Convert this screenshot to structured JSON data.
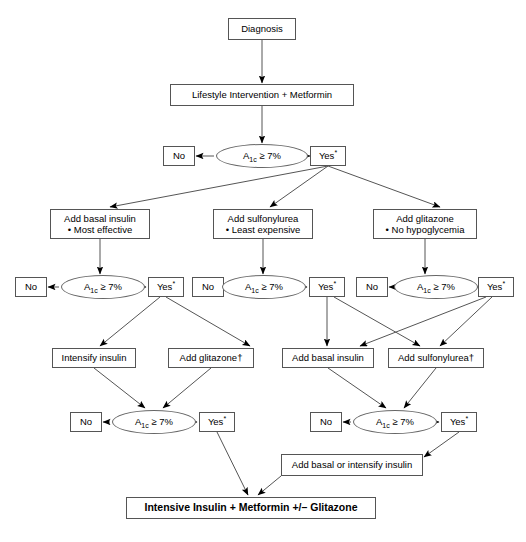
{
  "diagram": {
    "background_color": "#ffffff",
    "line_color": "#555555",
    "text_color": "#000000",
    "labels": {
      "diagnosis": "Diagnosis",
      "lifestyle": "Lifestyle Intervention + Metformin",
      "no": "No",
      "yes": "Yes",
      "yes_marker": "*",
      "a1c_prefix": "A",
      "a1c_sub": "1c",
      "a1c_suffix": " ≥ 7%",
      "basal_insulin_title": "Add basal insulin",
      "basal_insulin_note": "• Most effective",
      "sulfonylurea_title": "Add sulfonylurea",
      "sulfonylurea_note": "• Least expensive",
      "glitazone_title": "Add glitazone",
      "glitazone_note": "• No hypoglycemia",
      "intensify_insulin": "Intensify insulin",
      "add_glitazone_dagger": "Add glitazone†",
      "add_basal_insulin": "Add basal insulin",
      "add_sulfonylurea_dagger": "Add sulfonylurea†",
      "add_basal_or_intensify": "Add basal or intensify insulin",
      "final": "Intensive Insulin + Metformin +/– Glitazone"
    }
  },
  "nodes": [
    {
      "id": "diagnosis",
      "key": "diagnosis",
      "type": "process",
      "x": 228,
      "y": 18,
      "w": 68,
      "h": 22
    },
    {
      "id": "lifestyle",
      "key": "lifestyle",
      "type": "process",
      "x": 170,
      "y": 84,
      "w": 184,
      "h": 22
    },
    {
      "id": "dec1",
      "key": "a1c",
      "type": "decision",
      "x": 216,
      "y": 144,
      "w": 92,
      "h": 24
    },
    {
      "id": "dec1-no",
      "key": "no",
      "type": "process",
      "x": 163,
      "y": 146,
      "w": 32,
      "h": 20
    },
    {
      "id": "dec1-yes",
      "key": "yes",
      "type": "process",
      "x": 310,
      "y": 146,
      "w": 36,
      "h": 20
    },
    {
      "id": "basal-insulin",
      "key": "basal_insulin",
      "type": "process2",
      "x": 50,
      "y": 209,
      "w": 100,
      "h": 30
    },
    {
      "id": "sulfonylurea",
      "key": "sulfonylurea",
      "type": "process2",
      "x": 213,
      "y": 209,
      "w": 100,
      "h": 30
    },
    {
      "id": "glitazone",
      "key": "glitazone",
      "type": "process2",
      "x": 373,
      "y": 209,
      "w": 104,
      "h": 30
    },
    {
      "id": "dec2",
      "key": "a1c",
      "type": "decision",
      "x": 61,
      "y": 275,
      "w": 84,
      "h": 24
    },
    {
      "id": "dec2-no",
      "key": "no",
      "type": "process",
      "x": 15,
      "y": 277,
      "w": 32,
      "h": 20
    },
    {
      "id": "dec2-yes",
      "key": "yes",
      "type": "process",
      "x": 148,
      "y": 277,
      "w": 36,
      "h": 20
    },
    {
      "id": "dec3",
      "key": "a1c",
      "type": "decision",
      "x": 222,
      "y": 275,
      "w": 84,
      "h": 24
    },
    {
      "id": "dec3-no",
      "key": "no",
      "type": "process",
      "x": 192,
      "y": 277,
      "w": 32,
      "h": 20
    },
    {
      "id": "dec3-yes",
      "key": "yes",
      "type": "process",
      "x": 309,
      "y": 277,
      "w": 36,
      "h": 20
    },
    {
      "id": "dec4",
      "key": "a1c",
      "type": "decision",
      "x": 394,
      "y": 275,
      "w": 84,
      "h": 24
    },
    {
      "id": "dec4-no",
      "key": "no",
      "type": "process",
      "x": 356,
      "y": 277,
      "w": 32,
      "h": 20
    },
    {
      "id": "dec4-yes",
      "key": "yes",
      "type": "process",
      "x": 478,
      "y": 277,
      "w": 36,
      "h": 20
    },
    {
      "id": "intensify",
      "key": "intensify_insulin",
      "type": "process",
      "x": 52,
      "y": 348,
      "w": 84,
      "h": 20
    },
    {
      "id": "add-glitazone",
      "key": "add_glitazone_dagger",
      "type": "process",
      "x": 168,
      "y": 348,
      "w": 86,
      "h": 20
    },
    {
      "id": "add-basal",
      "key": "add_basal_insulin",
      "type": "process",
      "x": 282,
      "y": 348,
      "w": 92,
      "h": 20
    },
    {
      "id": "add-sulfonylurea",
      "key": "add_sulfonylurea_dagger",
      "type": "process",
      "x": 388,
      "y": 348,
      "w": 96,
      "h": 20
    },
    {
      "id": "dec5",
      "key": "a1c",
      "type": "decision",
      "x": 112,
      "y": 410,
      "w": 84,
      "h": 24
    },
    {
      "id": "dec5-no",
      "key": "no",
      "type": "process",
      "x": 70,
      "y": 412,
      "w": 32,
      "h": 20
    },
    {
      "id": "dec5-yes",
      "key": "yes",
      "type": "process",
      "x": 199,
      "y": 412,
      "w": 36,
      "h": 20
    },
    {
      "id": "dec6",
      "key": "a1c",
      "type": "decision",
      "x": 353,
      "y": 410,
      "w": 84,
      "h": 24
    },
    {
      "id": "dec6-no",
      "key": "no",
      "type": "process",
      "x": 310,
      "y": 412,
      "w": 32,
      "h": 20
    },
    {
      "id": "dec6-yes",
      "key": "yes",
      "type": "process",
      "x": 441,
      "y": 412,
      "w": 36,
      "h": 20
    },
    {
      "id": "add-basal-int",
      "key": "add_basal_or_intensify",
      "type": "process",
      "x": 281,
      "y": 454,
      "w": 142,
      "h": 22
    },
    {
      "id": "final",
      "key": "final",
      "type": "terminal",
      "x": 126,
      "y": 497,
      "w": 250,
      "h": 22
    }
  ],
  "edges": [
    {
      "from": "diagnosis",
      "to": "lifestyle",
      "style": "vertical"
    },
    {
      "from": "lifestyle",
      "to": "dec1",
      "style": "vertical"
    },
    {
      "from": "dec1",
      "to": "dec1-no",
      "style": "horizontal-left"
    },
    {
      "from": "dec1",
      "to": "dec1-yes",
      "style": "horizontal-right"
    },
    {
      "from": "dec1-yes",
      "to": "basal-insulin",
      "style": "diagonal"
    },
    {
      "from": "dec1-yes",
      "to": "sulfonylurea",
      "style": "diagonal"
    },
    {
      "from": "dec1-yes",
      "to": "glitazone",
      "style": "diagonal"
    },
    {
      "from": "basal-insulin",
      "to": "dec2",
      "style": "vertical"
    },
    {
      "from": "sulfonylurea",
      "to": "dec3",
      "style": "vertical"
    },
    {
      "from": "glitazone",
      "to": "dec4",
      "style": "vertical"
    },
    {
      "from": "dec2",
      "to": "dec2-no",
      "style": "horizontal-left"
    },
    {
      "from": "dec2",
      "to": "dec2-yes",
      "style": "horizontal-right"
    },
    {
      "from": "dec3",
      "to": "dec3-no",
      "style": "horizontal-left"
    },
    {
      "from": "dec3",
      "to": "dec3-yes",
      "style": "horizontal-right"
    },
    {
      "from": "dec4",
      "to": "dec4-no",
      "style": "horizontal-left"
    },
    {
      "from": "dec4",
      "to": "dec4-yes",
      "style": "horizontal-right"
    },
    {
      "from": "dec2-yes",
      "to": "intensify",
      "style": "diagonal"
    },
    {
      "from": "dec2-yes",
      "to": "add-glitazone",
      "style": "diagonal"
    },
    {
      "from": "dec3-yes",
      "to": "add-basal",
      "style": "vertical"
    },
    {
      "from": "dec3-yes",
      "to": "add-sulfonylurea",
      "style": "diagonal"
    },
    {
      "from": "dec4-yes",
      "to": "add-basal",
      "style": "diagonal"
    },
    {
      "from": "dec4-yes",
      "to": "add-sulfonylurea",
      "style": "diagonal"
    },
    {
      "from": "intensify",
      "to": "dec5",
      "style": "diagonal"
    },
    {
      "from": "add-glitazone",
      "to": "dec5",
      "style": "diagonal"
    },
    {
      "from": "add-basal",
      "to": "dec6",
      "style": "diagonal"
    },
    {
      "from": "add-sulfonylurea",
      "to": "dec6",
      "style": "diagonal"
    },
    {
      "from": "dec5",
      "to": "dec5-no",
      "style": "horizontal-left"
    },
    {
      "from": "dec5",
      "to": "dec5-yes",
      "style": "horizontal-right"
    },
    {
      "from": "dec6",
      "to": "dec6-no",
      "style": "horizontal-left"
    },
    {
      "from": "dec6",
      "to": "dec6-yes",
      "style": "horizontal-right"
    },
    {
      "from": "dec6-yes",
      "to": "add-basal-int",
      "style": "diagonal"
    },
    {
      "from": "add-basal-int",
      "to": "final",
      "style": "diagonal"
    },
    {
      "from": "dec5-yes",
      "to": "final",
      "style": "diagonal"
    }
  ]
}
